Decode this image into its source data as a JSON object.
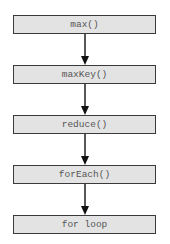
{
  "diagram": {
    "type": "vertical-flowchart",
    "nodes": [
      {
        "id": "n1",
        "label": "max()"
      },
      {
        "id": "n2",
        "label": "maxKey()"
      },
      {
        "id": "n3",
        "label": "reduce()"
      },
      {
        "id": "n4",
        "label": "forEach()"
      },
      {
        "id": "n5",
        "label": "for loop"
      }
    ],
    "edges": [
      {
        "from": "n1",
        "to": "n2"
      },
      {
        "from": "n2",
        "to": "n3"
      },
      {
        "from": "n3",
        "to": "n4"
      },
      {
        "from": "n4",
        "to": "n5"
      }
    ],
    "colors": {
      "box_fill": "#e3e3e3",
      "box_border": "#3a3a3a",
      "text": "#555555",
      "arrow": "#111111"
    }
  }
}
